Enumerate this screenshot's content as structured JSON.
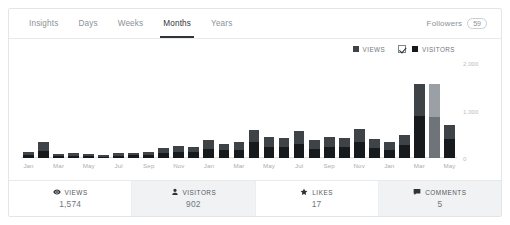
{
  "tabs": [
    {
      "label": "Insights",
      "active": false
    },
    {
      "label": "Days",
      "active": false
    },
    {
      "label": "Weeks",
      "active": false
    },
    {
      "label": "Months",
      "active": true
    },
    {
      "label": "Years",
      "active": false
    }
  ],
  "followers": {
    "label": "Followers",
    "count": "59"
  },
  "legend": [
    {
      "label": "VIEWS",
      "color": "#3e4347",
      "checkbox": false
    },
    {
      "label": "VISITORS",
      "color": "#161a1d",
      "checkbox": true
    }
  ],
  "stats": [
    {
      "icon": "eye-icon",
      "label": "VIEWS",
      "value": "1,574",
      "shaded": false
    },
    {
      "icon": "person-icon",
      "label": "VISITORS",
      "value": "902",
      "shaded": true
    },
    {
      "icon": "star-icon",
      "label": "LIKES",
      "value": "17",
      "shaded": false
    },
    {
      "icon": "comment-icon",
      "label": "COMMENTS",
      "value": "5",
      "shaded": true
    }
  ],
  "chart_data": {
    "type": "bar",
    "title": "",
    "xlabel": "",
    "ylabel": "",
    "ylim": [
      0,
      2000
    ],
    "yticks": [
      "0",
      "1,000",
      "2,000"
    ],
    "grid": false,
    "legend_position": "top-right",
    "categories": [
      "Jan",
      "Feb",
      "Mar",
      "Apr",
      "May",
      "Jun",
      "Jul",
      "Aug",
      "Sep",
      "Oct",
      "Nov",
      "Dec",
      "Jan",
      "Feb",
      "Mar",
      "Apr",
      "May",
      "Jun",
      "Jul",
      "Aug",
      "Sep",
      "Oct",
      "Nov",
      "Dec",
      "Jan",
      "Feb",
      "Mar",
      "Apr",
      "May"
    ],
    "tick_labels": [
      "Jan",
      "",
      "Mar",
      "",
      "May",
      "",
      "Jul",
      "",
      "Sep",
      "",
      "Nov",
      "",
      "Jan",
      "",
      "Mar",
      "",
      "May",
      "",
      "Jul",
      "",
      "Sep",
      "",
      "Nov",
      "",
      "Jan",
      "",
      "Mar",
      "",
      "May"
    ],
    "series": [
      {
        "name": "VIEWS",
        "color": "#3e4347",
        "values": [
          130,
          330,
          95,
          105,
          85,
          60,
          100,
          110,
          130,
          215,
          250,
          240,
          380,
          300,
          330,
          600,
          450,
          420,
          560,
          380,
          440,
          430,
          620,
          400,
          330,
          490,
          1560,
          1560,
          700
        ]
      },
      {
        "name": "VISITORS",
        "color": "#161a1d",
        "values": [
          60,
          150,
          45,
          50,
          40,
          30,
          50,
          55,
          65,
          110,
          130,
          125,
          200,
          160,
          175,
          330,
          240,
          225,
          300,
          200,
          235,
          230,
          340,
          215,
          175,
          265,
          880,
          860,
          400
        ]
      }
    ],
    "highlighted_index": 27
  }
}
